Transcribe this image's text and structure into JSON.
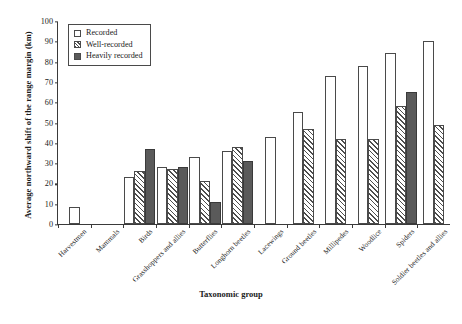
{
  "chart_data": {
    "type": "bar",
    "title": "",
    "xlabel": "Taxonomic group",
    "ylabel": "Average northward shift of the range margin (km)",
    "ylim": [
      0,
      100
    ],
    "ytick_step": 10,
    "yticks": [
      "100",
      "90",
      "80",
      "70",
      "60",
      "50",
      "40",
      "30",
      "20",
      "10",
      "0"
    ],
    "grid": false,
    "legend_position": "top-left",
    "categories": [
      "Harvestmen",
      "Mammals",
      "Birds",
      "Grasshoppers and allies",
      "Butterflies",
      "Longhorn beetles",
      "Lacewings",
      "Ground beetles",
      "Millipedes",
      "Woodlice",
      "Spiders",
      "Soldier beetles and allies"
    ],
    "series": [
      {
        "name": "Recorded",
        "style": "open",
        "color": "#ffffff",
        "values": [
          8.5,
          null,
          23,
          28,
          33,
          36,
          43,
          55,
          73,
          78,
          84,
          90
        ]
      },
      {
        "name": "Well-recorded",
        "style": "hatched",
        "color": "#4d4d4d",
        "values": [
          null,
          null,
          26,
          27,
          21,
          38,
          null,
          47,
          42,
          42,
          58,
          49
        ]
      },
      {
        "name": "Heavily recorded",
        "style": "solid",
        "color": "#5a5a5a",
        "values": [
          null,
          null,
          37,
          28,
          11,
          31,
          null,
          null,
          null,
          null,
          65,
          null
        ]
      }
    ]
  }
}
